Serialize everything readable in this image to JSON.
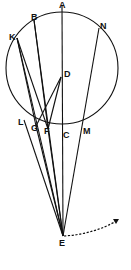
{
  "figure": {
    "type": "geometric diagram",
    "circle": {
      "cx": 62,
      "cy": 68,
      "r": 56
    },
    "points": [
      {
        "id": "A",
        "label": "A",
        "x": 62,
        "y": 6,
        "lx": 59,
        "ly": 8
      },
      {
        "id": "B",
        "label": "B",
        "x": 34,
        "y": 20,
        "lx": 31,
        "ly": 20
      },
      {
        "id": "N",
        "label": "N",
        "x": 99,
        "y": 28,
        "lx": 100,
        "ly": 29
      },
      {
        "id": "K",
        "label": "K",
        "x": 17,
        "y": 38,
        "lx": 9,
        "ly": 40
      },
      {
        "id": "D",
        "label": "D",
        "x": 61,
        "y": 77,
        "lx": 64,
        "ly": 77
      },
      {
        "id": "L",
        "label": "L",
        "x": 24,
        "y": 120,
        "lx": 18,
        "ly": 125
      },
      {
        "id": "G",
        "label": "G",
        "x": 36,
        "y": 126,
        "lx": 31,
        "ly": 131
      },
      {
        "id": "F",
        "label": "F",
        "x": 48,
        "y": 129,
        "lx": 44,
        "ly": 134
      },
      {
        "id": "C",
        "label": "C",
        "x": 62,
        "y": 130,
        "lx": 63,
        "ly": 138
      },
      {
        "id": "M",
        "label": "M",
        "x": 82,
        "y": 128,
        "lx": 83,
        "ly": 134
      },
      {
        "id": "E",
        "label": "E",
        "x": 63,
        "y": 236,
        "lx": 59,
        "ly": 246
      }
    ],
    "segments": [
      [
        "A",
        "E"
      ],
      [
        "B",
        "F"
      ],
      [
        "B",
        "E"
      ],
      [
        "K",
        "G"
      ],
      [
        "K",
        "E"
      ],
      [
        "K",
        "F"
      ],
      [
        "D",
        "G"
      ],
      [
        "D",
        "F"
      ],
      [
        "L",
        "E"
      ],
      [
        "G",
        "E"
      ],
      [
        "F",
        "E"
      ],
      [
        "N",
        "E"
      ]
    ],
    "arrow": {
      "from": "E",
      "style": "dashed",
      "path": "M64,236 Q95,234 118,220",
      "head": [
        118,
        220
      ]
    }
  }
}
